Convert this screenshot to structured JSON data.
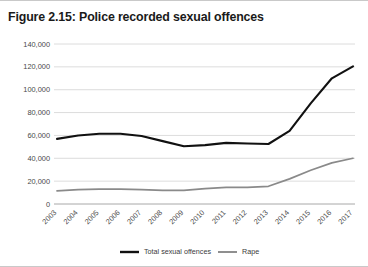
{
  "figure": {
    "title": "Figure 2.15: Police recorded sexual offences",
    "border_color": "#c9c9c9"
  },
  "legend": {
    "position": "bottom-center",
    "entries": [
      {
        "label": "Total sexual offences",
        "color": "#111111",
        "icon": "line-swatch-icon"
      },
      {
        "label": "Rape",
        "color": "#8a8a8a",
        "icon": "line-swatch-icon"
      }
    ]
  },
  "chart_data": {
    "type": "line",
    "title": "Figure 2.15: Police recorded sexual offences",
    "xlabel": "",
    "ylabel": "",
    "grid": true,
    "legend_position": "bottom",
    "categories": [
      "2003",
      "2004",
      "2005",
      "2006",
      "2007",
      "2008",
      "2009",
      "2010",
      "2011",
      "2012",
      "2013",
      "2014",
      "2015",
      "2016",
      "2017"
    ],
    "ylim": [
      0,
      140000
    ],
    "yticks": [
      0,
      20000,
      40000,
      60000,
      80000,
      100000,
      120000,
      140000
    ],
    "ytick_labels": [
      "0",
      "20,000",
      "40,000",
      "60,000",
      "80,000",
      "100,000",
      "120,000",
      "140,000"
    ],
    "series": [
      {
        "name": "Total sexual offences",
        "color": "#111111",
        "values": [
          57000,
          60000,
          61500,
          61500,
          59500,
          55000,
          50500,
          51500,
          53500,
          53000,
          52500,
          64000,
          88000,
          110000,
          120500
        ]
      },
      {
        "name": "Rape",
        "color": "#8a8a8a",
        "values": [
          11500,
          12500,
          13000,
          13000,
          12500,
          12000,
          12000,
          13500,
          14500,
          14500,
          15500,
          22000,
          29500,
          36000,
          40000
        ]
      }
    ]
  }
}
